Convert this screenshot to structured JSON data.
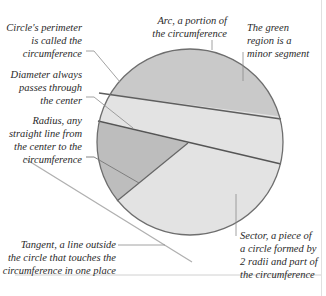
{
  "diagram": {
    "colors": {
      "circle_fill": "#d9d9d9",
      "segment_fill": "#c4c4c4",
      "sector_fill": "#b8b8b8",
      "light_band_fill": "#e4e4e4",
      "outline": "#707070",
      "chord": "#5a5a5a",
      "leader_line": "#8a8a8a",
      "tangent": "#b5b5b5",
      "rule": "#cfcfcf"
    },
    "labels": {
      "circumference": "Circle's perimeter\nis called the\ncircumference",
      "arc": "Arc, a portion of\nthe circumference",
      "segment": "The green\nregion is a\nminor segment",
      "diameter": "Diameter always\npasses through\nthe center",
      "radius": "Radius, any\nstraight line from\nthe center to the\ncircumference",
      "tangent": "Tangent, a line outside\nthe circle that touches the\ncircumference in one place",
      "sector": "Sector, a piece of\na circle formed by\n2 radii and part of\nthe circumference"
    }
  }
}
